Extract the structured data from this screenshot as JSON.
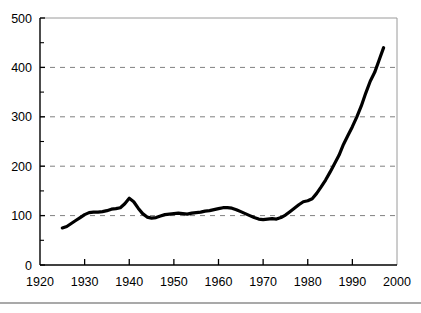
{
  "figure": {
    "background_color": "#ffffff",
    "line_color": "#000000",
    "grid_color": "#808080",
    "axis_color": "#000000",
    "footer_rule_color": "#555555"
  },
  "chart_data": {
    "type": "line",
    "title": "",
    "subtitle": "",
    "xlabel": "",
    "ylabel": "",
    "xlim": [
      1920,
      2000
    ],
    "ylim": [
      0,
      500
    ],
    "grid": true,
    "grid_axis": "y",
    "grid_style": "dashed",
    "legend": null,
    "legend_position": "none",
    "annotations": [],
    "xticks": [
      1920,
      1930,
      1940,
      1950,
      1960,
      1970,
      1980,
      1990,
      2000
    ],
    "xtick_labels": [
      "1920",
      "1930",
      "1940",
      "1950",
      "1960",
      "1970",
      "1980",
      "1990",
      "2000"
    ],
    "xtick_minor_count_between": 1,
    "yticks": [
      0,
      100,
      200,
      300,
      400,
      500
    ],
    "ytick_labels": [
      "0",
      "100",
      "200",
      "300",
      "400",
      "500"
    ],
    "ytick_minor": [
      50,
      150,
      250,
      350,
      450
    ],
    "series": [
      {
        "name": "series-1",
        "color": "#000000",
        "line_width": 3.2,
        "x": [
          1925,
          1926,
          1927,
          1928,
          1929,
          1930,
          1931,
          1932,
          1933,
          1934,
          1935,
          1936,
          1937,
          1938,
          1939,
          1940,
          1941,
          1942,
          1943,
          1944,
          1945,
          1946,
          1947,
          1948,
          1949,
          1950,
          1951,
          1952,
          1953,
          1954,
          1955,
          1956,
          1957,
          1958,
          1959,
          1960,
          1961,
          1962,
          1963,
          1964,
          1965,
          1966,
          1967,
          1968,
          1969,
          1970,
          1971,
          1972,
          1973,
          1974,
          1975,
          1976,
          1977,
          1978,
          1979,
          1980,
          1981,
          1982,
          1983,
          1984,
          1985,
          1986,
          1987,
          1988,
          1989,
          1990,
          1991,
          1992,
          1993,
          1994,
          1995,
          1996,
          1997
        ],
        "y": [
          75,
          78,
          84,
          90,
          96,
          102,
          106,
          107,
          107,
          108,
          110,
          113,
          114,
          116,
          124,
          135,
          128,
          115,
          104,
          97,
          95,
          96,
          99,
          102,
          103,
          104,
          105,
          104,
          103,
          105,
          106,
          107,
          109,
          110,
          112,
          114,
          116,
          116,
          115,
          112,
          108,
          104,
          100,
          96,
          93,
          92,
          93,
          94,
          93,
          96,
          101,
          108,
          115,
          122,
          128,
          130,
          134,
          145,
          158,
          172,
          188,
          205,
          222,
          244,
          262,
          280,
          300,
          322,
          348,
          372,
          390,
          415,
          440
        ]
      }
    ]
  },
  "axes": {
    "y_axis_name": "y-axis",
    "x_axis_name": "x-axis",
    "frame": "box"
  },
  "footer": {
    "rule": true
  }
}
